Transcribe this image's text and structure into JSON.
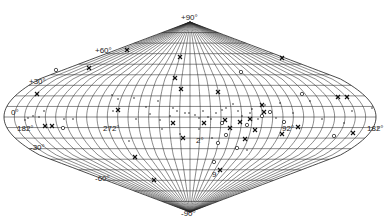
{
  "figure": {
    "projection": "all-sky diamond (sinusoidal-type) galactic projection",
    "background": "#ffffff",
    "line_color": "#2a2a2a"
  },
  "geometry": {
    "center_x": 190,
    "equator_y": 117,
    "north_pole_y": 22,
    "south_pole_y": 212,
    "half_width": 186,
    "lat_step_deg": 10,
    "lon_step_deg": 10
  },
  "latitude_labels": [
    {
      "text": "+90°",
      "x": 181,
      "y": 20
    },
    {
      "text": "+60°",
      "x": 95,
      "y": 53
    },
    {
      "text": "+30°",
      "x": 29,
      "y": 84
    },
    {
      "text": "0°",
      "x": 11,
      "y": 115
    },
    {
      "text": "-30°",
      "x": 30,
      "y": 150
    },
    {
      "text": "-60°",
      "x": 95,
      "y": 181
    },
    {
      "text": "-90°",
      "x": 181,
      "y": 216
    }
  ],
  "longitude_labels": [
    {
      "text": "182°",
      "x": 17,
      "y": 131
    },
    {
      "text": "272°",
      "x": 103,
      "y": 131
    },
    {
      "text": "2°",
      "x": 196,
      "y": 143
    },
    {
      "text": "92°",
      "x": 282,
      "y": 131
    },
    {
      "text": "182°",
      "x": 367,
      "y": 131
    }
  ],
  "markers": {
    "crosses": [
      [
        127,
        50
      ],
      [
        89,
        68
      ],
      [
        180,
        57
      ],
      [
        175,
        78
      ],
      [
        181,
        89
      ],
      [
        282,
        58
      ],
      [
        218,
        92
      ],
      [
        45,
        126
      ],
      [
        37,
        94
      ],
      [
        204,
        123
      ],
      [
        173,
        123
      ],
      [
        250,
        119
      ],
      [
        240,
        122
      ],
      [
        230,
        128
      ],
      [
        298,
        127
      ],
      [
        338,
        97
      ],
      [
        347,
        97
      ],
      [
        353,
        133
      ],
      [
        225,
        120
      ],
      [
        245,
        139
      ],
      [
        135,
        157
      ],
      [
        183,
        138
      ],
      [
        154,
        180
      ],
      [
        220,
        170
      ],
      [
        262,
        105
      ],
      [
        264,
        112
      ],
      [
        282,
        134
      ],
      [
        52,
        126
      ],
      [
        118,
        110
      ],
      [
        255,
        130
      ]
    ],
    "circles": [
      [
        56,
        70
      ],
      [
        241,
        72
      ],
      [
        302,
        94
      ],
      [
        63,
        128
      ],
      [
        222,
        123
      ],
      [
        284,
        122
      ],
      [
        237,
        148
      ],
      [
        226,
        135
      ],
      [
        270,
        112
      ],
      [
        334,
        136
      ],
      [
        214,
        162
      ],
      [
        262,
        116
      ],
      [
        218,
        143
      ],
      [
        247,
        125
      ]
    ],
    "dots": [
      [
        112,
        95
      ],
      [
        118,
        99
      ],
      [
        134,
        98
      ],
      [
        146,
        107
      ],
      [
        150,
        114
      ],
      [
        160,
        120
      ],
      [
        113,
        111
      ],
      [
        73,
        119
      ],
      [
        64,
        119
      ],
      [
        28,
        118
      ],
      [
        33,
        116
      ],
      [
        39,
        117
      ],
      [
        44,
        111
      ],
      [
        25,
        120
      ],
      [
        136,
        119
      ],
      [
        158,
        101
      ],
      [
        173,
        108
      ],
      [
        177,
        111
      ],
      [
        185,
        113
      ],
      [
        189,
        113
      ],
      [
        195,
        115
      ],
      [
        199,
        118
      ],
      [
        211,
        119
      ],
      [
        216,
        113
      ],
      [
        222,
        110
      ],
      [
        226,
        108
      ],
      [
        233,
        104
      ],
      [
        238,
        111
      ],
      [
        242,
        116
      ],
      [
        250,
        113
      ],
      [
        252,
        109
      ],
      [
        258,
        119
      ],
      [
        265,
        105
      ],
      [
        276,
        118
      ],
      [
        280,
        103
      ],
      [
        293,
        113
      ],
      [
        310,
        101
      ],
      [
        352,
        111
      ],
      [
        372,
        108
      ],
      [
        378,
        128
      ],
      [
        344,
        123
      ],
      [
        322,
        119
      ],
      [
        170,
        116
      ],
      [
        203,
        111
      ],
      [
        208,
        117
      ],
      [
        199,
        129
      ],
      [
        247,
        150
      ],
      [
        180,
        134
      ],
      [
        162,
        129
      ],
      [
        212,
        138
      ],
      [
        129,
        141
      ]
    ]
  },
  "annotations": [
    {
      "text": "9",
      "x": 212,
      "y": 177
    }
  ]
}
